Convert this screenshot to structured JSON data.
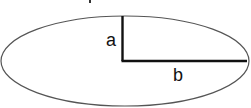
{
  "diagram": {
    "type": "ellipse-semi-axes",
    "labels": {
      "semi_minor": "a",
      "semi_major": "b"
    },
    "colors": {
      "ellipse_stroke": "#555555",
      "axis_stroke": "#111111",
      "background": "#ffffff"
    }
  }
}
